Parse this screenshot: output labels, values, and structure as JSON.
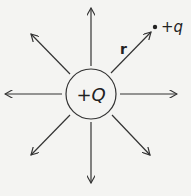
{
  "diagram": {
    "center_charge": {
      "label": "+Q",
      "cx": 91,
      "cy": 94,
      "r": 25
    },
    "test_charge": {
      "label": "+q",
      "x": 155,
      "y": 27
    },
    "distance_label": "r",
    "field_lines": [
      {
        "direction": "up",
        "x1": 91,
        "y1": 66,
        "x2": 91,
        "y2": 8
      },
      {
        "direction": "down",
        "x1": 91,
        "y1": 122,
        "x2": 91,
        "y2": 183
      },
      {
        "direction": "left",
        "x1": 62,
        "y1": 94,
        "x2": 5,
        "y2": 94
      },
      {
        "direction": "right",
        "x1": 120,
        "y1": 94,
        "x2": 177,
        "y2": 94
      },
      {
        "direction": "up-left",
        "x1": 70,
        "y1": 74,
        "x2": 31,
        "y2": 34
      },
      {
        "direction": "up-right",
        "x1": 111,
        "y1": 73,
        "x2": 151,
        "y2": 32
      },
      {
        "direction": "down-left",
        "x1": 70,
        "y1": 115,
        "x2": 31,
        "y2": 155
      },
      {
        "direction": "down-right",
        "x1": 112,
        "y1": 115,
        "x2": 150,
        "y2": 155
      }
    ],
    "colors": {
      "line": "#333333",
      "background": "#f4f4f2"
    }
  }
}
